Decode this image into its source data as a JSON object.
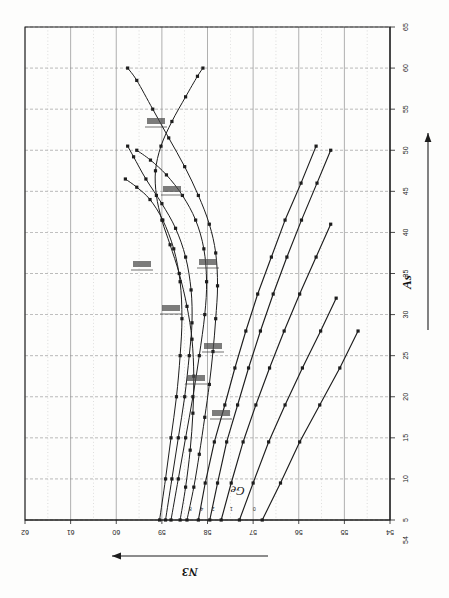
{
  "figure": {
    "kind": "scanned-technical-graph",
    "orientation": "rotated-90",
    "background_color": "#fdfdfc",
    "ink_color": "#1d1d1d",
    "grid_color": "#8e8e8e"
  },
  "axes": {
    "bottom": {
      "name": "N3",
      "title": "N3",
      "arrow": "left",
      "tick_labels": [
        "62",
        "61",
        "60",
        "59",
        "58",
        "57",
        "56",
        "55",
        "54"
      ],
      "range": [
        62,
        54
      ],
      "minor_per_major": 2
    },
    "right": {
      "name": "As",
      "title": "As",
      "arrow": "up",
      "tick_labels": [
        "65",
        "60",
        "55",
        "50",
        "45",
        "40",
        "35",
        "30",
        "25",
        "20",
        "15",
        "10",
        "5"
      ],
      "range": [
        65,
        5
      ]
    }
  },
  "annotations": {
    "curve_family_label": "Ge",
    "line_end_labels": [
      "8",
      "4",
      "2",
      "1",
      "0"
    ],
    "inline_labels": [
      "",
      "",
      "",
      "",
      "",
      "",
      "",
      ""
    ]
  },
  "chart_data": {
    "type": "line",
    "title": "",
    "xlabel": "N3",
    "ylabel": "As",
    "xlim": [
      62,
      54
    ],
    "ylim": [
      5,
      65
    ],
    "grid": true,
    "legend": "none",
    "series": [
      {
        "name": "Ge-8",
        "label": "8",
        "points": [
          [
            58.2,
            5.0
          ],
          [
            58.05,
            9.5
          ],
          [
            57.85,
            14.5
          ],
          [
            57.62,
            19.0
          ],
          [
            57.4,
            23.5
          ],
          [
            57.16,
            28.0
          ],
          [
            56.9,
            32.5
          ],
          [
            56.6,
            37.0
          ],
          [
            56.3,
            41.5
          ],
          [
            55.95,
            46.0
          ],
          [
            55.62,
            50.5
          ]
        ]
      },
      {
        "name": "Ge-4",
        "label": "4",
        "points": [
          [
            57.95,
            5.0
          ],
          [
            57.78,
            9.5
          ],
          [
            57.58,
            14.5
          ],
          [
            57.34,
            19.0
          ],
          [
            57.1,
            23.5
          ],
          [
            56.84,
            28.0
          ],
          [
            56.56,
            32.5
          ],
          [
            56.26,
            37.0
          ],
          [
            55.94,
            41.5
          ],
          [
            55.6,
            46.0
          ],
          [
            55.3,
            50.0
          ]
        ]
      },
      {
        "name": "Ge-2",
        "label": "2",
        "points": [
          [
            57.7,
            5.0
          ],
          [
            57.48,
            9.5
          ],
          [
            57.22,
            14.5
          ],
          [
            56.94,
            19.0
          ],
          [
            56.64,
            23.5
          ],
          [
            56.32,
            28.0
          ],
          [
            55.98,
            32.5
          ],
          [
            55.62,
            37.0
          ],
          [
            55.3,
            41.0
          ]
        ]
      },
      {
        "name": "Ge-1",
        "label": "1",
        "points": [
          [
            57.3,
            5.0
          ],
          [
            57.0,
            9.5
          ],
          [
            56.66,
            14.5
          ],
          [
            56.3,
            19.0
          ],
          [
            55.92,
            23.5
          ],
          [
            55.52,
            28.0
          ],
          [
            55.18,
            32.0
          ]
        ]
      },
      {
        "name": "Ge-0",
        "label": "0",
        "points": [
          [
            56.8,
            5.0
          ],
          [
            56.4,
            9.5
          ],
          [
            55.98,
            14.5
          ],
          [
            55.54,
            19.0
          ],
          [
            55.1,
            23.5
          ],
          [
            54.7,
            28.0
          ]
        ]
      },
      {
        "name": "loop-outer",
        "label": "",
        "points": [
          [
            58.45,
            5.0
          ],
          [
            58.3,
            9.0
          ],
          [
            58.18,
            13.0
          ],
          [
            58.06,
            17.5
          ],
          [
            57.96,
            21.5
          ],
          [
            57.88,
            25.5
          ],
          [
            57.82,
            29.5
          ],
          [
            57.78,
            33.5
          ],
          [
            57.82,
            37.5
          ],
          [
            57.96,
            41.0
          ],
          [
            58.2,
            44.5
          ],
          [
            58.5,
            48.0
          ],
          [
            58.85,
            51.5
          ],
          [
            59.2,
            55.0
          ],
          [
            59.55,
            58.5
          ],
          [
            59.75,
            60.0
          ]
        ]
      },
      {
        "name": "loop-inner",
        "label": "",
        "points": [
          [
            58.6,
            5.0
          ],
          [
            58.48,
            9.0
          ],
          [
            58.38,
            13.5
          ],
          [
            58.32,
            18.0
          ],
          [
            58.3,
            22.5
          ],
          [
            58.34,
            27.0
          ],
          [
            58.45,
            31.0
          ],
          [
            58.62,
            35.0
          ],
          [
            58.82,
            38.5
          ],
          [
            59.0,
            41.5
          ],
          [
            59.12,
            44.5
          ],
          [
            59.14,
            47.5
          ],
          [
            59.02,
            50.5
          ],
          [
            58.78,
            53.5
          ],
          [
            58.48,
            56.5
          ],
          [
            58.22,
            59.0
          ],
          [
            58.1,
            60.0
          ]
        ]
      },
      {
        "name": "branch-a",
        "label": "",
        "points": [
          [
            58.8,
            5.0
          ],
          [
            58.64,
            10.0
          ],
          [
            58.48,
            15.0
          ],
          [
            58.32,
            20.0
          ],
          [
            58.18,
            25.0
          ],
          [
            58.06,
            30.0
          ],
          [
            58.02,
            34.0
          ],
          [
            58.08,
            38.0
          ],
          [
            58.26,
            41.5
          ],
          [
            58.55,
            44.5
          ],
          [
            58.9,
            47.0
          ],
          [
            59.25,
            48.8
          ],
          [
            59.55,
            50.0
          ]
        ]
      },
      {
        "name": "branch-b",
        "label": "",
        "points": [
          [
            58.92,
            5.0
          ],
          [
            58.78,
            10.0
          ],
          [
            58.64,
            15.0
          ],
          [
            58.5,
            20.0
          ],
          [
            58.4,
            25.0
          ],
          [
            58.34,
            29.0
          ],
          [
            58.36,
            33.0
          ],
          [
            58.48,
            37.0
          ],
          [
            58.7,
            40.5
          ],
          [
            59.0,
            43.5
          ],
          [
            59.35,
            46.5
          ],
          [
            59.62,
            49.2
          ],
          [
            59.75,
            50.5
          ]
        ]
      },
      {
        "name": "branch-c",
        "label": "",
        "points": [
          [
            59.05,
            5.0
          ],
          [
            58.92,
            10.0
          ],
          [
            58.8,
            15.0
          ],
          [
            58.68,
            20.0
          ],
          [
            58.6,
            25.0
          ],
          [
            58.56,
            29.5
          ],
          [
            58.6,
            34.0
          ],
          [
            58.74,
            38.0
          ],
          [
            58.98,
            41.5
          ],
          [
            59.26,
            44.0
          ],
          [
            59.55,
            45.5
          ],
          [
            59.8,
            46.5
          ]
        ]
      }
    ]
  }
}
